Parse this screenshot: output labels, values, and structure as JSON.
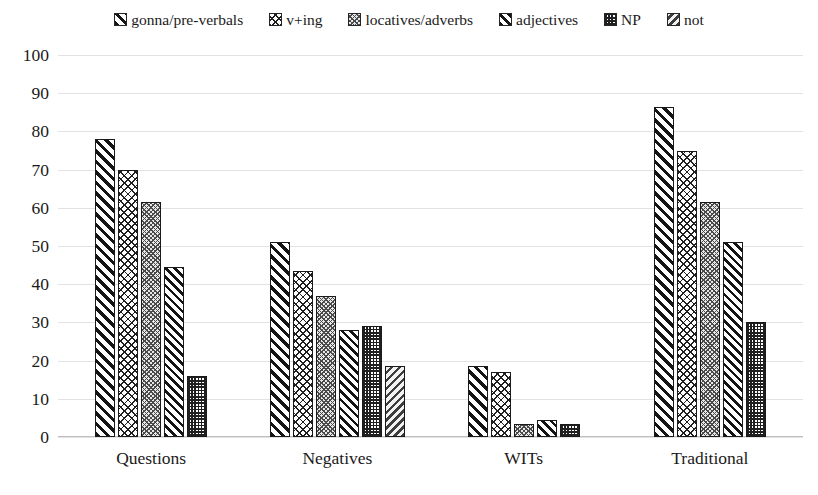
{
  "chart_data": {
    "type": "bar",
    "title": "",
    "xlabel": "",
    "ylabel": "",
    "ylim": [
      0,
      100
    ],
    "ytick_step": 10,
    "yticks": [
      "100",
      "90",
      "80",
      "70",
      "60",
      "50",
      "40",
      "30",
      "20",
      "10",
      "0"
    ],
    "grid": true,
    "legend_position": "top-center",
    "categories": [
      "Questions",
      "Negatives",
      "WITs",
      "Traditional"
    ],
    "series": [
      {
        "name": "gonna/pre-verbals",
        "pattern": "wide-diagonal-stripes",
        "values": [
          78,
          51,
          18.5,
          86.5
        ]
      },
      {
        "name": "v+ing",
        "pattern": "brick-crosshatch",
        "values": [
          70,
          43.5,
          17,
          75
        ]
      },
      {
        "name": "locatives/adverbs",
        "pattern": "grey-zigzag-weave",
        "values": [
          61.5,
          37,
          3.5,
          61.5
        ]
      },
      {
        "name": "adjectives",
        "pattern": "narrow-diagonal-stripes",
        "values": [
          44.5,
          28,
          4.5,
          51
        ]
      },
      {
        "name": "NP",
        "pattern": "checkerboard",
        "values": [
          16,
          29,
          3.5,
          30
        ]
      },
      {
        "name": "not",
        "pattern": "grey-reverse-diagonal-stripes",
        "values": [
          null,
          18.5,
          null,
          null
        ]
      }
    ]
  },
  "colors": {
    "gridline": "#e2e2e2",
    "bar_outline": "#1a1a1a",
    "text": "#1a1a1a",
    "background": "#ffffff"
  }
}
